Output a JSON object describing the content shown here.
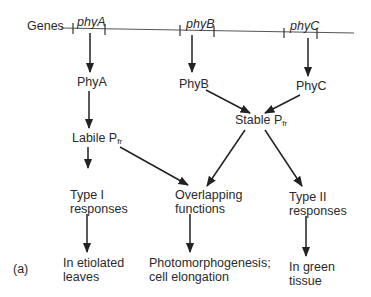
{
  "genes": {
    "label": "Genes",
    "items": [
      {
        "name": "phyA"
      },
      {
        "name": "phyB"
      },
      {
        "name": "phyC"
      }
    ]
  },
  "proteins": {
    "phyA": "PhyA",
    "phyB": "PhyB",
    "phyC": "PhyC"
  },
  "pfr": {
    "labile_prefix": "Labile P",
    "labile_sub": "fr",
    "stable_prefix": "Stable P",
    "stable_sub": "fr"
  },
  "responses": {
    "type1_line1": "Type I",
    "type1_line2": "responses",
    "overlap_line1": "Overlapping",
    "overlap_line2": "functions",
    "type2_line1": "Type II",
    "type2_line2": "responses"
  },
  "outcomes": {
    "etiolated_line1": "In etiolated",
    "etiolated_line2": "leaves",
    "photo_line1": "Photomorphogenesis;",
    "photo_line2": "cell elongation",
    "green_line1": "In green",
    "green_line2": "tissue"
  },
  "panel_label": "(a)",
  "colors": {
    "ink": "#2a2a2a",
    "background": "#ffffff"
  }
}
